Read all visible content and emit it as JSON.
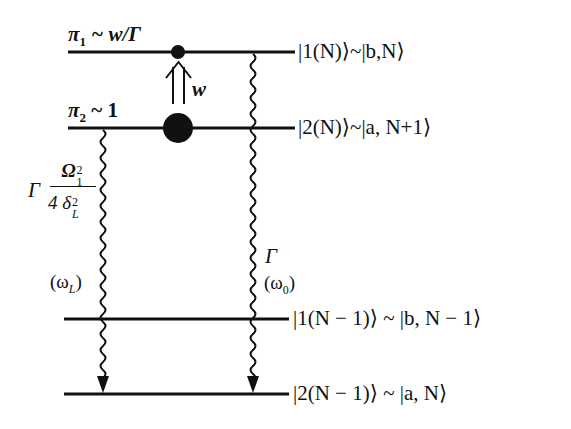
{
  "diagram": {
    "type": "energy-level-diagram",
    "levels": [
      {
        "id": "level-1N",
        "population_label": "π₁ ~ w/Γ",
        "state_label": "|1(N)⟩~|b,N⟩"
      },
      {
        "id": "level-2N",
        "population_label": "π₂ ~ 1",
        "state_label": "|2(N)⟩~|a, N+1⟩"
      },
      {
        "id": "level-1N-1",
        "state_label": "|1(N − 1)⟩ ~ |b, N − 1⟩"
      },
      {
        "id": "level-2N-1",
        "state_label": "|2(N − 1)⟩ ~ |a, N⟩"
      }
    ],
    "pump": {
      "label": "w",
      "from": "level-2N",
      "to": "level-1N"
    },
    "transitions": [
      {
        "id": "left-decay",
        "from": "level-2N",
        "to": "level-2N-1",
        "rate_prefix": "Γ",
        "rate_numerator": "Ω",
        "rate_num_sub": "1",
        "rate_num_sup": "2",
        "rate_denominator": "4 δ",
        "rate_den_sub": "L",
        "rate_den_sup": "2",
        "frequency_label": "(ω",
        "frequency_sub": "L",
        "frequency_close": ")"
      },
      {
        "id": "right-decay",
        "from": "level-1N",
        "to": "level-2N-1",
        "rate": "Γ",
        "frequency_label": "(ω",
        "frequency_sub": "0",
        "frequency_close": ")"
      }
    ]
  },
  "labels": {
    "pi1": "π",
    "pi1_sub": "1",
    "pi1_rest": " ~ w/Γ",
    "pi2": "π",
    "pi2_sub": "2",
    "pi2_rest": " ~ 1",
    "w": "w",
    "state1": "|1(N)⟩~|b,N⟩",
    "state2": "|2(N)⟩~|a, N+1⟩",
    "state3": "|1(N − 1)⟩ ~ |b, N − 1⟩",
    "state4": "|2(N − 1)⟩ ~ |a, N⟩"
  }
}
